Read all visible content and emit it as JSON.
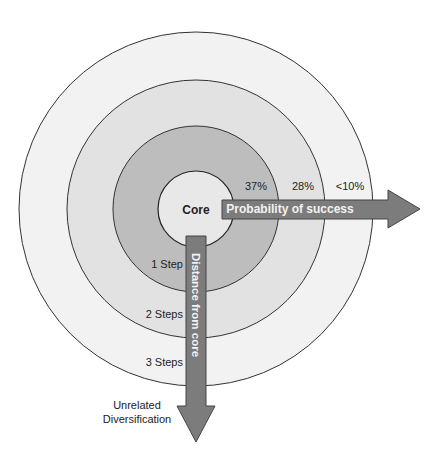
{
  "colors": {
    "background": "#ffffff",
    "ring_outer": "#f2f2f2",
    "ring_second": "#e2e2e2",
    "ring_third": "#bdbdbd",
    "core": "#e8e8e8",
    "stroke": "#333333",
    "arrow_fill": "#7c7c7c",
    "arrow_stroke": "#444444",
    "arrow_text": "#f2f2f2"
  },
  "core": {
    "label": "Core"
  },
  "probabilities": [
    {
      "ring": "1 step",
      "value": "37%"
    },
    {
      "ring": "2 steps",
      "value": "28%"
    },
    {
      "ring": "3 steps",
      "value": "<10%"
    }
  ],
  "steps": [
    {
      "label": "1 Step"
    },
    {
      "label": "2 Steps"
    },
    {
      "label": "3 Steps"
    }
  ],
  "arrows": {
    "horizontal": {
      "label": "Probability of success"
    },
    "vertical": {
      "label": "Distance from core"
    }
  },
  "endpoint": {
    "line1": "Unrelated",
    "line2": "Diversification"
  }
}
